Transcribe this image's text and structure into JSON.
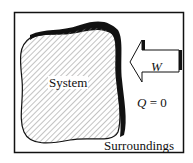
{
  "diagram": {
    "system_label": "System",
    "work_label": "W",
    "heat_label_var": "Q",
    "heat_label_rest": " = 0",
    "surroundings_label": "Surroundings",
    "colors": {
      "line": "#111111",
      "hatch": "#777777",
      "background": "#ffffff"
    }
  }
}
